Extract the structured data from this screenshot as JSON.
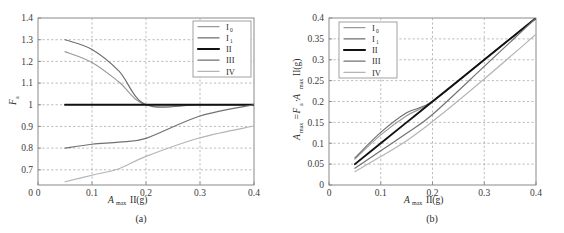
{
  "figure": {
    "panels": [
      {
        "caption": "(a)",
        "xlabel_main": "A",
        "xlabel_sub": "max",
        "xlabel_tail": "II(g)",
        "ylabel_main": "F",
        "ylabel_sub": "a"
      },
      {
        "caption": "(b)",
        "xlabel_main": "A",
        "xlabel_sub": "max",
        "xlabel_tail": "II(g)",
        "ylabel_main": "A",
        "ylabel_sub": "max",
        "ylabel_tail": "=F",
        "ylabel_sub2": "a",
        "ylabel_tail2": "·A",
        "ylabel_sub3": "max",
        "ylabel_tail3": "II(g)"
      }
    ]
  },
  "legend": {
    "entries": [
      {
        "label": "I",
        "sub": "0",
        "color": "#9a9a9a",
        "width": 1.3
      },
      {
        "label": "I",
        "sub": "1",
        "color": "#6e6e6e",
        "width": 1.3
      },
      {
        "label": "II",
        "sub": "",
        "color": "#111111",
        "width": 2.1
      },
      {
        "label": "III",
        "sub": "",
        "color": "#717171",
        "width": 1.3
      },
      {
        "label": "IV",
        "sub": "",
        "color": "#b4b4b4",
        "width": 1.3
      }
    ]
  },
  "chart_data": [
    {
      "type": "line",
      "panel": "(a)",
      "title": "",
      "xlabel": "A_max II(g)",
      "ylabel": "F_a",
      "xlim": [
        0,
        0.4
      ],
      "ylim": [
        0.63,
        1.4
      ],
      "xticks": [
        0,
        0.1,
        0.2,
        0.3,
        0.4
      ],
      "xtick_labels": [
        "0",
        "0.1",
        "0.2",
        "0.3",
        "0.4"
      ],
      "yticks": [
        0.7,
        0.8,
        0.9,
        1.0,
        1.1,
        1.2,
        1.3,
        1.4
      ],
      "ytick_labels": [
        "0.7",
        "0.8",
        "0.9",
        "1",
        "1.1",
        "1.2",
        "1.3",
        "1.4"
      ],
      "grid": true,
      "legend_position": "top-right",
      "series": [
        {
          "name": "I0",
          "color": "#9a9a9a",
          "x": [
            0.05,
            0.1,
            0.15,
            0.2,
            0.3,
            0.4
          ],
          "y": [
            1.245,
            1.195,
            1.105,
            1.0,
            1.0,
            1.0
          ]
        },
        {
          "name": "I1",
          "color": "#6e6e6e",
          "x": [
            0.05,
            0.1,
            0.15,
            0.2,
            0.3,
            0.4
          ],
          "y": [
            1.3,
            1.255,
            1.155,
            1.0,
            1.0,
            1.0
          ]
        },
        {
          "name": "II",
          "color": "#111111",
          "x": [
            0.05,
            0.1,
            0.15,
            0.2,
            0.3,
            0.4
          ],
          "y": [
            1.0,
            1.0,
            1.0,
            1.0,
            1.0,
            1.0
          ]
        },
        {
          "name": "III",
          "color": "#717171",
          "x": [
            0.05,
            0.1,
            0.15,
            0.2,
            0.3,
            0.4
          ],
          "y": [
            0.8,
            0.818,
            0.828,
            0.845,
            0.948,
            1.0
          ]
        },
        {
          "name": "IV",
          "color": "#b4b4b4",
          "x": [
            0.05,
            0.1,
            0.15,
            0.2,
            0.3,
            0.4
          ],
          "y": [
            0.645,
            0.675,
            0.705,
            0.762,
            0.848,
            0.902
          ]
        }
      ]
    },
    {
      "type": "line",
      "panel": "(b)",
      "title": "",
      "xlabel": "A_max II(g)",
      "ylabel": "A_max = F_a · A_max II(g)",
      "xlim": [
        0,
        0.4
      ],
      "ylim": [
        0,
        0.4
      ],
      "xticks": [
        0,
        0.1,
        0.2,
        0.3,
        0.4
      ],
      "xtick_labels": [
        "0",
        "0.1",
        "0.2",
        "0.3",
        "0.4"
      ],
      "yticks": [
        0,
        0.05,
        0.1,
        0.15,
        0.2,
        0.25,
        0.3,
        0.35,
        0.4
      ],
      "ytick_labels": [
        "0",
        "0.05",
        "0.1",
        "0.15",
        "0.2",
        "0.25",
        "0.3",
        "0.35",
        "0.4"
      ],
      "grid": true,
      "legend_position": "top-left",
      "series": [
        {
          "name": "I0",
          "color": "#9a9a9a",
          "x": [
            0.05,
            0.1,
            0.15,
            0.2,
            0.3,
            0.4
          ],
          "y": [
            0.062,
            0.12,
            0.166,
            0.2,
            0.3,
            0.4
          ]
        },
        {
          "name": "I1",
          "color": "#6e6e6e",
          "x": [
            0.05,
            0.1,
            0.15,
            0.2,
            0.3,
            0.4
          ],
          "y": [
            0.065,
            0.126,
            0.173,
            0.2,
            0.3,
            0.4
          ]
        },
        {
          "name": "II",
          "color": "#111111",
          "x": [
            0.05,
            0.1,
            0.15,
            0.2,
            0.3,
            0.4
          ],
          "y": [
            0.05,
            0.1,
            0.15,
            0.2,
            0.3,
            0.4
          ]
        },
        {
          "name": "III",
          "color": "#717171",
          "x": [
            0.05,
            0.1,
            0.15,
            0.2,
            0.3,
            0.4
          ],
          "y": [
            0.04,
            0.082,
            0.124,
            0.169,
            0.284,
            0.4
          ]
        },
        {
          "name": "IV",
          "color": "#b4b4b4",
          "x": [
            0.05,
            0.1,
            0.15,
            0.2,
            0.3,
            0.4
          ],
          "y": [
            0.032,
            0.068,
            0.106,
            0.152,
            0.254,
            0.361
          ]
        }
      ]
    }
  ]
}
